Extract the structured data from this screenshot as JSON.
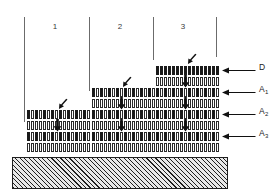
{
  "figure": {
    "background_color": "#ffffff",
    "line_color": "#6b6b6b",
    "cell_fill_color": "#1a1a1a",
    "cell_open_color": "#ffffff",
    "substrate_color": "#cfcfcf"
  },
  "columns": [
    {
      "number": "1",
      "layer_count": 4
    },
    {
      "number": "2",
      "layer_count": 6
    },
    {
      "number": "3",
      "layer_count": 8
    }
  ],
  "labels": [
    {
      "id": "D",
      "text": "D",
      "sub": ""
    },
    {
      "id": "A1",
      "text": "A",
      "sub": "1"
    },
    {
      "id": "A2",
      "text": "A",
      "sub": "2"
    },
    {
      "id": "A3",
      "text": "A",
      "sub": "3"
    }
  ],
  "icons": {
    "diagonal_pointer": "diagonal-arrow-icon",
    "down_arrow": "down-arrow-icon",
    "leader_arrow": "left-arrow-icon"
  },
  "substrate": {
    "name": "hatched-substrate",
    "hatch": "diagonal"
  }
}
